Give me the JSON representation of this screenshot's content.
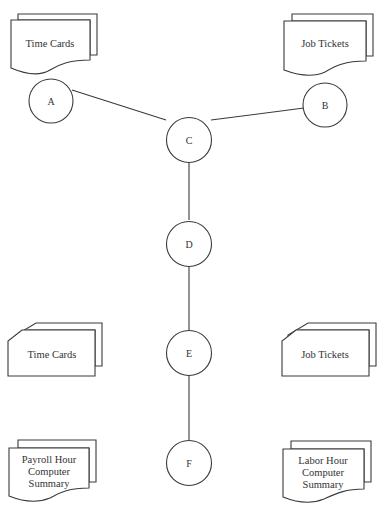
{
  "diagram": {
    "type": "flowchart",
    "colors": {
      "stroke": "#3a3a3a",
      "text": "#333333",
      "background": "#ffffff"
    },
    "documents": {
      "top_left": {
        "shape": "multiple-documents",
        "label": "Time Cards"
      },
      "top_right": {
        "shape": "multiple-documents",
        "label": "Job Tickets"
      },
      "bottom_left": {
        "shape": "multiple-documents",
        "lines": [
          "Payroll Hour",
          "Computer",
          "Summary"
        ]
      },
      "bottom_right": {
        "shape": "multiple-documents",
        "lines": [
          "Labor Hour",
          "Computer",
          "Summary"
        ]
      }
    },
    "cards": {
      "mid_left": {
        "shape": "punched-cards",
        "label": "Time Cards"
      },
      "mid_right": {
        "shape": "punched-cards",
        "label": "Job Tickets"
      }
    },
    "nodes": {
      "A": "A",
      "B": "B",
      "C": "C",
      "D": "D",
      "E": "E",
      "F": "F"
    },
    "edges": [
      [
        "A",
        "C"
      ],
      [
        "B",
        "C"
      ],
      [
        "C",
        "D"
      ],
      [
        "D",
        "E"
      ],
      [
        "E",
        "F"
      ]
    ]
  }
}
